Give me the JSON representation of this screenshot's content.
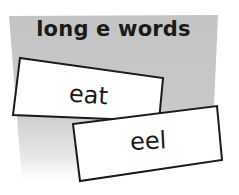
{
  "panel": {
    "heading": "long e words",
    "background_color": "#c4c4c4"
  },
  "cards": [
    {
      "word": "eat"
    },
    {
      "word": "eel"
    }
  ],
  "colors": {
    "card_fill": "#ffffff",
    "card_border": "#1a1a1a",
    "text": "#1a1a1a"
  }
}
